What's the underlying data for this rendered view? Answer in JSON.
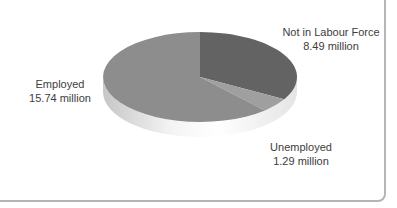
{
  "chart_data": {
    "type": "pie",
    "title": "",
    "unit": "million",
    "direction": "clockwise",
    "start_angle_deg": 0,
    "style": "3d",
    "legend_position": "outside-labels",
    "slices": [
      {
        "label": "Not in Labour Force",
        "value": 8.49,
        "value_text": "8.49 million",
        "color": "#636363"
      },
      {
        "label": "Unemployed",
        "value": 1.29,
        "value_text": "1.29 million",
        "color": "#9f9f9f"
      },
      {
        "label": "Employed",
        "value": 15.74,
        "value_text": "15.74 million",
        "color": "#8d8d8d"
      }
    ]
  }
}
